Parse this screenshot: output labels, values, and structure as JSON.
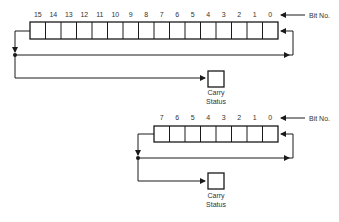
{
  "diagrams": [
    {
      "name": "16-bit-rotate",
      "bits": [
        "15",
        "14",
        "13",
        "12",
        "11",
        "10",
        "9",
        "8",
        "7",
        "6",
        "5",
        "4",
        "3",
        "2",
        "1",
        "0"
      ],
      "bit_no_label": "Bit No.",
      "carry_label_line1": "Carry",
      "carry_label_line2": "Status"
    },
    {
      "name": "8-bit-rotate",
      "bits": [
        "7",
        "6",
        "5",
        "4",
        "3",
        "2",
        "1",
        "0"
      ],
      "bit_no_label": "Bit No.",
      "carry_label_line1": "Carry",
      "carry_label_line2": "Status"
    }
  ],
  "colors": {
    "line": "#1a1a1a",
    "text": "#333333",
    "background": "#ffffff"
  }
}
